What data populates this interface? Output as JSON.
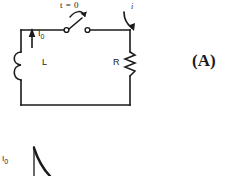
{
  "figure": {
    "id": "(A)",
    "type": "RL circuit schematic with decay graph",
    "panel_label": "(A)"
  },
  "circuit": {
    "switch_label": "t = 0",
    "current_label": "i",
    "initial_current_label_html": "I<sub>0</sub>",
    "inductor_label": "L",
    "resistor_label": "R",
    "components": [
      {
        "name": "inductor",
        "label": "L",
        "side": "left"
      },
      {
        "name": "resistor",
        "label": "R",
        "side": "right"
      },
      {
        "name": "switch",
        "label": "t = 0",
        "side": "top",
        "state": "open"
      }
    ],
    "arrows": [
      {
        "name": "initial-current-arrow",
        "direction": "up",
        "label": "I0"
      },
      {
        "name": "switch-open-arrow",
        "direction": "up-right"
      },
      {
        "name": "loop-current-arrow",
        "direction": "clockwise",
        "label": "i"
      }
    ]
  },
  "graph": {
    "y_axis_label_html": "I<sub>0</sub>",
    "curve": "exponential decay"
  },
  "colors": {
    "ink": "#1a1a1a",
    "background": "#ffffff"
  }
}
